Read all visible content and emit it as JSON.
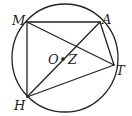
{
  "diagram": {
    "type": "geometry",
    "colors": {
      "stroke": "#222222",
      "background": "#ffffff"
    },
    "circle": {
      "center_label": "O"
    },
    "points": {
      "M": {
        "label": "M"
      },
      "A": {
        "label": "A"
      },
      "T": {
        "label": "T"
      },
      "H": {
        "label": "H"
      },
      "O": {
        "label": "O"
      },
      "Z": {
        "label": "Z"
      }
    },
    "segments": [
      "MA",
      "AT",
      "TH",
      "HM",
      "MT",
      "HA"
    ]
  }
}
